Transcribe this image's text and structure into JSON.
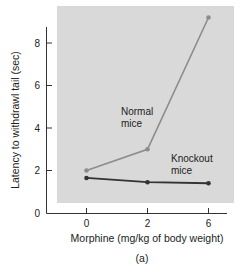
{
  "chart_data": {
    "type": "line",
    "title": "",
    "caption": "(a)",
    "xlabel": "Morphine (mg/kg of body weight)",
    "ylabel": "Latency to withdrawl tail (sec)",
    "categories": [
      "0",
      "2",
      "6"
    ],
    "yticks": [
      "0",
      "2",
      "4",
      "6",
      "8"
    ],
    "ylim": [
      0,
      9.5
    ],
    "grid": false,
    "legend": "inline annotations",
    "series": [
      {
        "name": "Normal mice",
        "label_line1": "Normal",
        "label_line2": "mice",
        "color": "#8c8c8c",
        "values": [
          2.0,
          3.0,
          9.2
        ]
      },
      {
        "name": "Knockout mice",
        "label_line1": "Knockout",
        "label_line2": "mice",
        "color": "#333333",
        "values": [
          1.65,
          1.45,
          1.4
        ]
      }
    ],
    "plot_background": "#d9d9d9"
  }
}
